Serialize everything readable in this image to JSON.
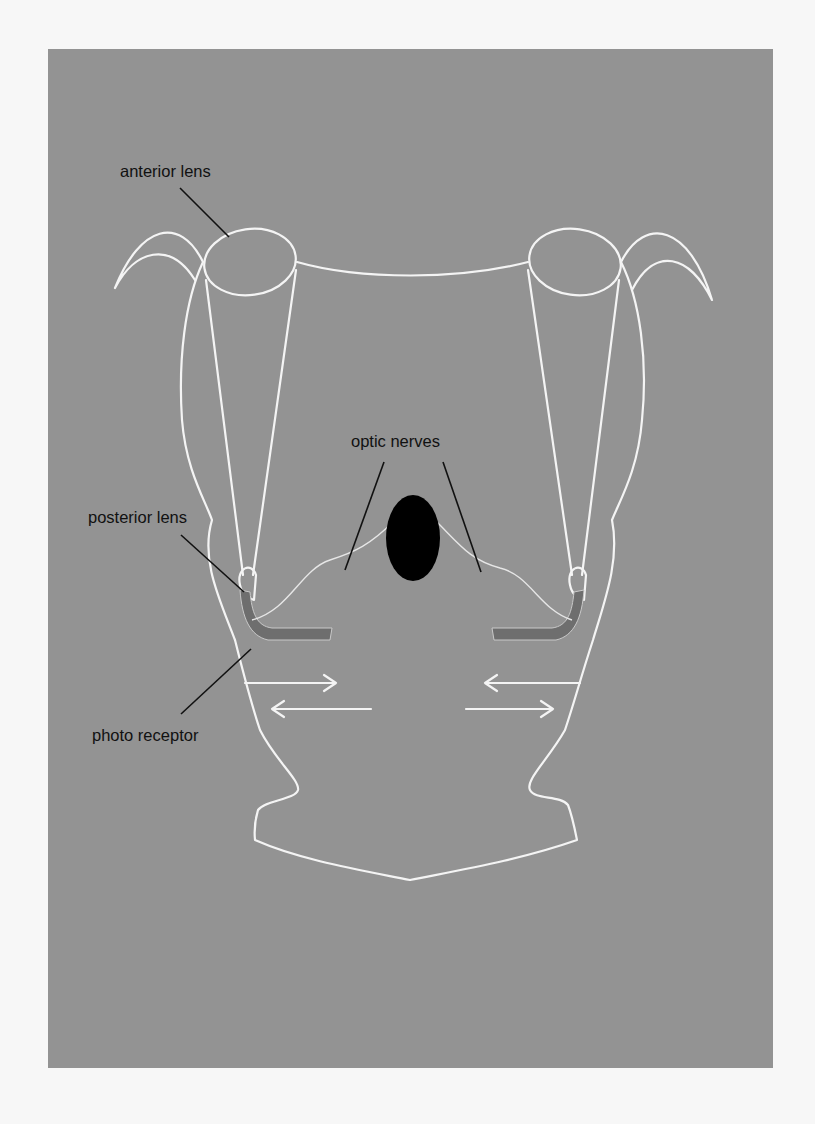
{
  "figure": {
    "labels": {
      "anterior_lens": "anterior lens",
      "optic_nerves": "optic nerves",
      "posterior_lens": "posterior lens",
      "photo_receptor": "photo receptor"
    },
    "colors": {
      "page_background": "#f7f7f7",
      "panel_background": "#939393",
      "outline": "#f4f4f4",
      "receptor": "#6e6e6e",
      "brain": "#000000",
      "leader_line": "#111111",
      "text": "#111111"
    }
  }
}
